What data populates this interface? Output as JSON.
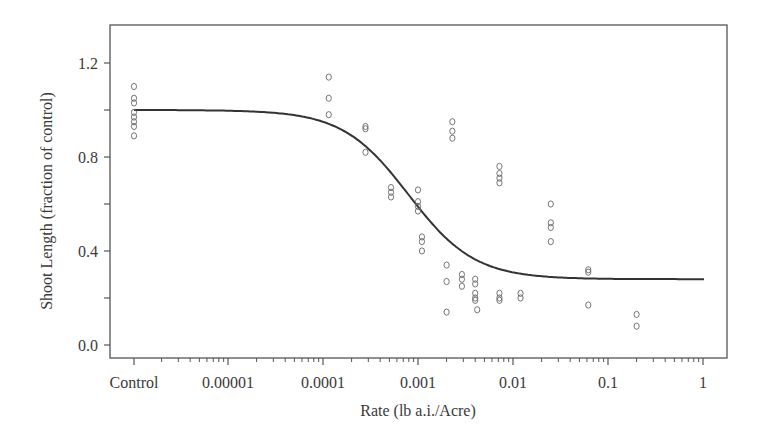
{
  "chart_data": {
    "type": "scatter",
    "title": "",
    "xlabel": "Rate (lb a.i./Acre)",
    "ylabel": "Shoot Length (fraction of control)",
    "x_scale": "log",
    "x_ticks": [
      "Control",
      "0.00001",
      "0.0001",
      "0.001",
      "0.01",
      "0.1",
      "1"
    ],
    "y_ticks": [
      "0.0",
      "0.4",
      "0.8",
      "1.2"
    ],
    "y_minor_ticks": [
      0.2,
      0.6,
      1.0
    ],
    "ylim": [
      -0.05,
      1.35
    ],
    "grid": false,
    "legend": null,
    "series": [
      {
        "name": "observations",
        "marker": "open-circle",
        "points": [
          {
            "x": "Control",
            "y": 1.1
          },
          {
            "x": "Control",
            "y": 1.05
          },
          {
            "x": "Control",
            "y": 1.03
          },
          {
            "x": "Control",
            "y": 0.99
          },
          {
            "x": "Control",
            "y": 0.97
          },
          {
            "x": "Control",
            "y": 0.95
          },
          {
            "x": "Control",
            "y": 0.93
          },
          {
            "x": "Control",
            "y": 0.89
          },
          {
            "x": 0.000115,
            "y": 1.14
          },
          {
            "x": 0.000115,
            "y": 1.05
          },
          {
            "x": 0.000115,
            "y": 0.98
          },
          {
            "x": 0.00028,
            "y": 0.92
          },
          {
            "x": 0.00028,
            "y": 0.93
          },
          {
            "x": 0.00028,
            "y": 0.82
          },
          {
            "x": 0.00052,
            "y": 0.67
          },
          {
            "x": 0.00052,
            "y": 0.65
          },
          {
            "x": 0.00052,
            "y": 0.63
          },
          {
            "x": 0.001,
            "y": 0.66
          },
          {
            "x": 0.001,
            "y": 0.61
          },
          {
            "x": 0.001,
            "y": 0.59
          },
          {
            "x": 0.001,
            "y": 0.57
          },
          {
            "x": 0.0011,
            "y": 0.46
          },
          {
            "x": 0.0011,
            "y": 0.44
          },
          {
            "x": 0.0011,
            "y": 0.4
          },
          {
            "x": 0.002,
            "y": 0.34
          },
          {
            "x": 0.002,
            "y": 0.27
          },
          {
            "x": 0.002,
            "y": 0.14
          },
          {
            "x": 0.0023,
            "y": 0.95
          },
          {
            "x": 0.0023,
            "y": 0.91
          },
          {
            "x": 0.0023,
            "y": 0.88
          },
          {
            "x": 0.0029,
            "y": 0.3
          },
          {
            "x": 0.0029,
            "y": 0.28
          },
          {
            "x": 0.0029,
            "y": 0.25
          },
          {
            "x": 0.004,
            "y": 0.28
          },
          {
            "x": 0.004,
            "y": 0.26
          },
          {
            "x": 0.004,
            "y": 0.22
          },
          {
            "x": 0.004,
            "y": 0.2
          },
          {
            "x": 0.004,
            "y": 0.19
          },
          {
            "x": 0.0042,
            "y": 0.15
          },
          {
            "x": 0.0072,
            "y": 0.76
          },
          {
            "x": 0.0072,
            "y": 0.73
          },
          {
            "x": 0.0072,
            "y": 0.71
          },
          {
            "x": 0.0072,
            "y": 0.69
          },
          {
            "x": 0.0072,
            "y": 0.22
          },
          {
            "x": 0.0072,
            "y": 0.2
          },
          {
            "x": 0.0072,
            "y": 0.19
          },
          {
            "x": 0.012,
            "y": 0.22
          },
          {
            "x": 0.012,
            "y": 0.2
          },
          {
            "x": 0.025,
            "y": 0.6
          },
          {
            "x": 0.025,
            "y": 0.52
          },
          {
            "x": 0.025,
            "y": 0.5
          },
          {
            "x": 0.025,
            "y": 0.44
          },
          {
            "x": 0.062,
            "y": 0.32
          },
          {
            "x": 0.062,
            "y": 0.31
          },
          {
            "x": 0.062,
            "y": 0.17
          },
          {
            "x": 0.2,
            "y": 0.13
          },
          {
            "x": 0.2,
            "y": 0.08
          }
        ]
      },
      {
        "name": "fitted dose-response curve",
        "type": "line",
        "points": [
          {
            "x": "Control",
            "y": 1.0
          },
          {
            "x": 1e-05,
            "y": 1.0
          },
          {
            "x": 3e-05,
            "y": 0.99
          },
          {
            "x": 0.0001,
            "y": 0.94
          },
          {
            "x": 0.0002,
            "y": 0.87
          },
          {
            "x": 0.0004,
            "y": 0.76
          },
          {
            "x": 0.0007,
            "y": 0.66
          },
          {
            "x": 0.001,
            "y": 0.61
          },
          {
            "x": 0.002,
            "y": 0.47
          },
          {
            "x": 0.004,
            "y": 0.38
          },
          {
            "x": 0.007,
            "y": 0.33
          },
          {
            "x": 0.015,
            "y": 0.3
          },
          {
            "x": 0.03,
            "y": 0.29
          },
          {
            "x": 0.1,
            "y": 0.28
          },
          {
            "x": 1,
            "y": 0.28
          }
        ]
      }
    ]
  }
}
